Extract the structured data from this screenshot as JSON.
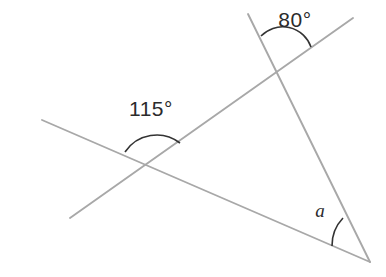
{
  "diagram": {
    "kind": "geometry-angle-diagram",
    "canvas": {
      "width": 386,
      "height": 277
    },
    "colors": {
      "background": "#ffffff",
      "line": "#a8a8a8",
      "arc": "#333333",
      "label": "#2b2b2b"
    },
    "stroke_widths": {
      "line": 1.9,
      "arc": 1.6
    },
    "lines": [
      {
        "name": "transversal-line",
        "from": {
          "x": 70,
          "y": 218
        },
        "to": {
          "x": 353,
          "y": 18
        }
      },
      {
        "name": "right-descending-line",
        "from": {
          "x": 248,
          "y": 14
        },
        "to": {
          "x": 370,
          "y": 262
        }
      },
      {
        "name": "base-line",
        "from": {
          "x": 42,
          "y": 120
        },
        "to": {
          "x": 370,
          "y": 262
        }
      }
    ],
    "vertices": [
      {
        "name": "upper-intersection",
        "x": 282,
        "y": 58
      },
      {
        "name": "left-intersection",
        "x": 152,
        "y": 168
      },
      {
        "name": "right-apex",
        "x": 370,
        "y": 262
      }
    ],
    "arcs": [
      {
        "name": "arc-80-degrees",
        "path": "M 261 36 A 30 30 0 0 1 311 47",
        "vertex": "upper-intersection"
      },
      {
        "name": "arc-115-degrees",
        "path": "M 125 152 A 38 38 0 0 1 180 143",
        "vertex": "left-intersection"
      },
      {
        "name": "arc-angle-a",
        "path": "M 332 246 A 40 40 0 0 1 343 218",
        "vertex": "right-apex"
      }
    ],
    "labels": [
      {
        "name": "label-80-degrees",
        "text": "80°",
        "value": 80,
        "unit": "degrees",
        "x": 295,
        "y": 21,
        "style": "upright",
        "at_vertex": "upper-intersection"
      },
      {
        "name": "label-115-degrees",
        "text": "115°",
        "value": 115,
        "unit": "degrees",
        "x": 151,
        "y": 110,
        "style": "upright",
        "at_vertex": "left-intersection"
      },
      {
        "name": "label-angle-a",
        "text": "a",
        "value": null,
        "unit": "unknown",
        "x": 320,
        "y": 213,
        "style": "italic",
        "at_vertex": "right-apex"
      }
    ]
  },
  "chart_data": {
    "type": "diagram",
    "known_angles": [
      {
        "label": "80°",
        "value": 80
      },
      {
        "label": "115°",
        "value": 115
      }
    ],
    "unknown_angles": [
      {
        "label": "a",
        "value": null
      }
    ]
  }
}
